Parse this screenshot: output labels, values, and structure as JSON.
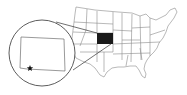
{
  "map": {
    "subject": "United States locator map",
    "highlighted_state": "Colorado",
    "highlight_color": "#1a1a1a",
    "outline_color": "#8a8a8a",
    "inset_outline_color": "#333333",
    "inset": {
      "shape": "circle",
      "content": "Colorado outline",
      "marker": {
        "icon": "star-icon",
        "position": "southwest, near southern border"
      }
    }
  }
}
